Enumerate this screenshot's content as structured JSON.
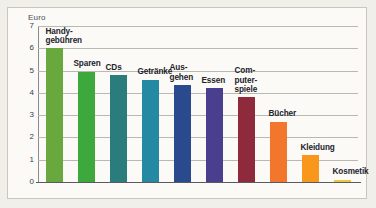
{
  "chart_data": {
    "type": "bar",
    "title": "",
    "subtitle": "",
    "xlabel": "",
    "ylabel": "Euro",
    "unit_label": "Euro",
    "ylim": [
      0,
      7
    ],
    "yticks": [
      0,
      1,
      2,
      3,
      4,
      5,
      6,
      7
    ],
    "ytick_labels": [
      "0",
      "1",
      "2",
      "3",
      "4",
      "5",
      "6",
      "7"
    ],
    "grid": true,
    "grid_axis": "y",
    "legend": "none",
    "categories": [
      "Handy-­gebühren",
      "Sparen",
      "CDs",
      "Getränke",
      "Ausgehen",
      "Essen",
      "Computerspiele",
      "Bücher",
      "Kleidung",
      "Kosmetik"
    ],
    "values": [
      6.0,
      4.95,
      4.8,
      4.6,
      4.35,
      4.2,
      3.8,
      2.7,
      1.2,
      0.1
    ],
    "bars": [
      {
        "label_lines": [
          "Handy-",
          "gebühren"
        ],
        "value": 6.0,
        "color": "#69a83e"
      },
      {
        "label_lines": [
          "Sparen"
        ],
        "value": 4.95,
        "color": "#3da93c"
      },
      {
        "label_lines": [
          "CDs"
        ],
        "value": 4.8,
        "color": "#2a7d7c"
      },
      {
        "label_lines": [
          "Getränke"
        ],
        "value": 4.6,
        "color": "#2489a3"
      },
      {
        "label_lines": [
          "Aus-",
          "gehen"
        ],
        "value": 4.35,
        "color": "#2a4a8e"
      },
      {
        "label_lines": [
          "Essen"
        ],
        "value": 4.2,
        "color": "#4a3f8e"
      },
      {
        "label_lines": [
          "Com-",
          "puter-",
          "spiele"
        ],
        "value": 3.8,
        "color": "#8e2a3c"
      },
      {
        "label_lines": [
          "Bücher"
        ],
        "value": 2.7,
        "color": "#f2762c"
      },
      {
        "label_lines": [
          "Kleidung"
        ],
        "value": 1.2,
        "color": "#f9971d"
      },
      {
        "label_lines": [
          "Kosmetik"
        ],
        "value": 0.1,
        "color": "#ecc83c"
      }
    ]
  },
  "colors": {
    "page_background": "#f0efe9",
    "plot_background": "#fbfaf6",
    "frame_border": "#c9c7bd",
    "gridline": "#b9b8b2",
    "axis": "#5a5a64",
    "tick_text": "#3e3e46",
    "label_text": "#22222a"
  }
}
